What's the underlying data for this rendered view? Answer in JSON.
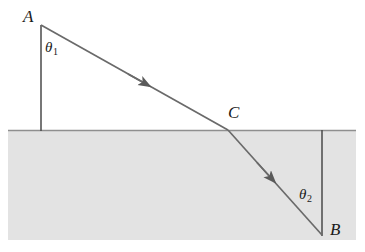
{
  "figure": {
    "type": "refraction-ray-diagram",
    "background_color": "#ffffff",
    "line_color": "#5a5a5a",
    "text_color": "#1a1a1a",
    "medium_fill_color": "#e3e3e3",
    "medium_edge_color": "#9a9a9a"
  },
  "labels": {
    "point_a": "A",
    "point_b": "B",
    "point_c": "C",
    "angle_incidence": "θ",
    "angle_incidence_sub": "1",
    "angle_refraction": "θ",
    "angle_refraction_sub": "2"
  },
  "geometry": {
    "point_a": {
      "x": 41,
      "y": 25
    },
    "point_c": {
      "x": 228,
      "y": 130
    },
    "point_b": {
      "x": 322,
      "y": 235
    },
    "normal_top": {
      "x1": 41,
      "y1": 25,
      "x2": 41,
      "y2": 131
    },
    "normal_bottom": {
      "x1": 322,
      "y1": 130,
      "x2": 322,
      "y2": 236
    },
    "interface": {
      "x1": 8,
      "y1": 130,
      "x2": 356,
      "y2": 130
    },
    "medium_rect": {
      "x": 8,
      "y": 130,
      "width": 348,
      "height": 110
    },
    "incident_ray": {
      "x1": 41,
      "y1": 25,
      "x2": 228,
      "y2": 130
    },
    "refracted_ray": {
      "x1": 228,
      "y1": 130,
      "x2": 322,
      "y2": 235
    },
    "incident_arrow": {
      "x": 142,
      "y": 82
    },
    "refracted_arrow": {
      "x": 272,
      "y": 180
    }
  }
}
